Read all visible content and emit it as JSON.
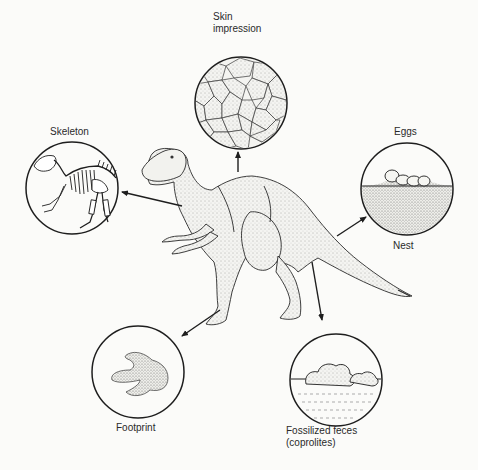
{
  "figure": {
    "colors": {
      "background": "#fbfbf9",
      "ink": "#1e1e1e",
      "stipple": "#555555"
    }
  },
  "labels": {
    "skin_line1": "Skin",
    "skin_line2": "impression",
    "skeleton": "Skeleton",
    "eggs": "Eggs",
    "nest": "Nest",
    "footprint": "Footprint",
    "feces_line1": "Fossilized feces",
    "feces_line2": "(coprolites)"
  },
  "insets": [
    {
      "id": "skin-impression",
      "cx": 241,
      "cy": 103,
      "r": 46
    },
    {
      "id": "skeleton",
      "cx": 72,
      "cy": 188,
      "r": 46
    },
    {
      "id": "eggs-nest",
      "cx": 407,
      "cy": 189,
      "r": 46
    },
    {
      "id": "footprint",
      "cx": 138,
      "cy": 372,
      "r": 46
    },
    {
      "id": "coprolites",
      "cx": 336,
      "cy": 380,
      "r": 46
    }
  ]
}
